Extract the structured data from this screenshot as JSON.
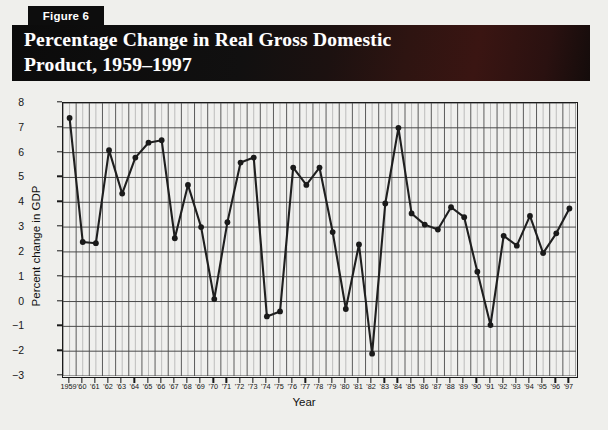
{
  "figure": {
    "tab_label": "Figure 6",
    "title": "Percentage Change in Real Gross Domestic\nProduct, 1959–1997"
  },
  "colors": {
    "banner_start": "#0b0b0b",
    "banner_accent": "#3a1512",
    "page_background": "#efefec",
    "plot_background": "#f0f0ee",
    "axis": "#1a1a1a",
    "gridline_major": "#4a4a4a",
    "gridline_minor": "#9a9a9a",
    "series_line": "#1f1f1f",
    "marker": "#1a1a1a"
  },
  "chart_data": {
    "type": "line",
    "title": "Percentage Change in Real Gross Domestic Product, 1959–1997",
    "xlabel": "Year",
    "ylabel": "Percent change in GDP",
    "ylim": [
      -3,
      8
    ],
    "ytick_labels": [
      "8",
      "7",
      "6",
      "5",
      "4",
      "3",
      "2",
      "1",
      "0",
      "−1",
      "−2",
      "−3"
    ],
    "yticks": [
      8,
      7,
      6,
      5,
      4,
      3,
      2,
      1,
      0,
      -1,
      -2,
      -3
    ],
    "grid": true,
    "legend": "none",
    "x": [
      1959,
      1960,
      1961,
      1962,
      1963,
      1964,
      1965,
      1966,
      1967,
      1968,
      1969,
      1970,
      1971,
      1972,
      1973,
      1974,
      1975,
      1976,
      1977,
      1978,
      1979,
      1980,
      1981,
      1982,
      1983,
      1984,
      1985,
      1986,
      1987,
      1988,
      1989,
      1990,
      1991,
      1992,
      1993,
      1994,
      1995,
      1996,
      1997
    ],
    "xtick_labels": [
      "1959",
      "'60",
      "'61",
      "'62",
      "'63",
      "'64",
      "'65",
      "'66",
      "'67",
      "'68",
      "'69",
      "'70",
      "'71",
      "'72",
      "'73",
      "'74",
      "'75",
      "'76",
      "'77",
      "'78",
      "'79",
      "'80",
      "'81",
      "'82",
      "'83",
      "'84",
      "'85",
      "'86",
      "'87",
      "'88",
      "'89",
      "'90",
      "'91",
      "'92",
      "'93",
      "'94",
      "'95",
      "'96",
      "'97"
    ],
    "series": [
      {
        "name": "Percent change in real GDP",
        "values": [
          7.4,
          2.4,
          2.35,
          6.1,
          4.35,
          5.8,
          6.4,
          6.5,
          2.55,
          4.7,
          3.0,
          0.1,
          3.2,
          5.6,
          5.8,
          -0.6,
          -0.4,
          5.4,
          4.7,
          5.4,
          2.8,
          -0.3,
          2.3,
          -2.1,
          3.95,
          7.0,
          3.55,
          3.1,
          2.9,
          3.8,
          3.4,
          1.2,
          -0.95,
          2.65,
          2.25,
          3.45,
          1.95,
          2.75,
          3.75
        ]
      }
    ]
  }
}
